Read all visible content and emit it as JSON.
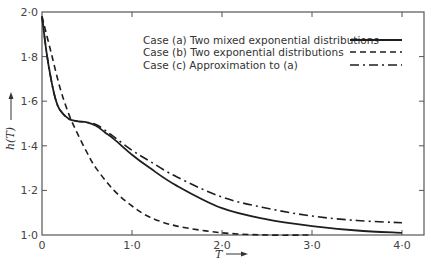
{
  "chart_data": {
    "type": "line",
    "title": "",
    "xlabel": "T",
    "ylabel": "h(T)",
    "xlim": [
      0,
      4.0
    ],
    "ylim": [
      1.0,
      2.0
    ],
    "grid": false,
    "legend_position": "upper right",
    "x_ticks": [
      {
        "value": 0,
        "label": "0"
      },
      {
        "value": 1.0,
        "label": "1·0"
      },
      {
        "value": 2.0,
        "label": "2·0"
      },
      {
        "value": 3.0,
        "label": "3·0"
      },
      {
        "value": 4.0,
        "label": "4·0"
      }
    ],
    "y_ticks": [
      {
        "value": 1.0,
        "label": "1·0"
      },
      {
        "value": 1.2,
        "label": "1·2"
      },
      {
        "value": 1.4,
        "label": "1·4"
      },
      {
        "value": 1.6,
        "label": "1·6"
      },
      {
        "value": 1.8,
        "label": "1·8"
      },
      {
        "value": 2.0,
        "label": "2·0"
      }
    ],
    "series": [
      {
        "name": "Case (a) Two mixed exponential distributions",
        "style": "solid",
        "x": [
          0,
          0.05,
          0.1,
          0.15,
          0.2,
          0.3,
          0.4,
          0.5,
          0.6,
          0.7,
          0.8,
          1.0,
          1.2,
          1.5,
          2.0,
          2.5,
          3.0,
          3.5,
          4.0
        ],
        "values": [
          1.98,
          1.82,
          1.7,
          1.61,
          1.56,
          1.52,
          1.51,
          1.505,
          1.49,
          1.46,
          1.43,
          1.36,
          1.3,
          1.22,
          1.12,
          1.07,
          1.04,
          1.02,
          1.01
        ]
      },
      {
        "name": "Case (b) Two exponential distributions",
        "style": "dashed",
        "x": [
          0,
          0.1,
          0.2,
          0.3,
          0.4,
          0.5,
          0.6,
          0.8,
          1.0,
          1.2,
          1.5,
          2.0,
          2.5,
          3.0
        ],
        "values": [
          1.98,
          1.82,
          1.66,
          1.54,
          1.45,
          1.37,
          1.3,
          1.2,
          1.13,
          1.08,
          1.04,
          1.01,
          1.0,
          1.0
        ]
      },
      {
        "name": "Case (c) Approximation to (a)",
        "style": "dashdot",
        "x": [
          0,
          0.05,
          0.1,
          0.15,
          0.2,
          0.3,
          0.4,
          0.5,
          0.6,
          0.7,
          0.8,
          1.0,
          1.2,
          1.5,
          2.0,
          2.5,
          3.0,
          3.5,
          4.0
        ],
        "values": [
          1.98,
          1.82,
          1.7,
          1.61,
          1.56,
          1.52,
          1.51,
          1.505,
          1.495,
          1.47,
          1.44,
          1.38,
          1.33,
          1.26,
          1.17,
          1.12,
          1.085,
          1.065,
          1.055
        ]
      }
    ]
  },
  "legend": {
    "items": [
      {
        "label": "Case (a) Two mixed exponential distributions",
        "style": "solid"
      },
      {
        "label": "Case (b) Two exponential distributions",
        "style": "dashed"
      },
      {
        "label": "Case (c) Approximation to (a)",
        "style": "dashdot"
      }
    ]
  },
  "axes": {
    "x_title": "T",
    "y_title": "h(T)",
    "arrow": "→"
  },
  "colors": {
    "line": "#1e1e1e",
    "axis": "#555555",
    "background": "#ffffff"
  }
}
